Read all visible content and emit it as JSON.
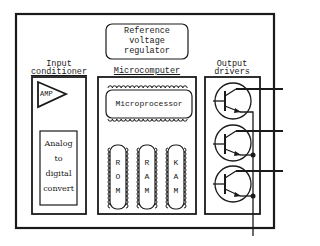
{
  "diagram": {
    "type": "block-diagram",
    "title": "",
    "colors": {
      "line": "#1a1a1a",
      "background": "#ffffff"
    },
    "blocks": {
      "reference_regulator": {
        "line1": "Reference",
        "line2": "voltage",
        "line3": "regulator"
      },
      "input_conditioner": {
        "title_line1": "Input",
        "title_line2": "conditioner",
        "amp_label": "AMP",
        "adc_line1": "Analog",
        "adc_line2": "to",
        "adc_line3": "digital",
        "adc_line4": "convert"
      },
      "microcomputer": {
        "title": "Microcomputer",
        "processor_label": "Microprocessor",
        "chips": [
          {
            "name": "ROM",
            "letters": [
              "R",
              "O",
              "M"
            ]
          },
          {
            "name": "RAM",
            "letters": [
              "R",
              "A",
              "M"
            ]
          },
          {
            "name": "KAM",
            "letters": [
              "K",
              "A",
              "M"
            ]
          }
        ]
      },
      "output_drivers": {
        "title_line1": "Output",
        "title_line2": "drivers",
        "transistor_count": 3
      }
    }
  }
}
